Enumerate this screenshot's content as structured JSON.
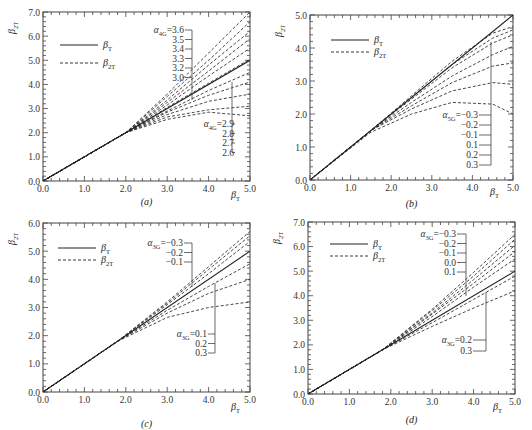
{
  "figure": {
    "panels_count": 4
  },
  "chart_data": [
    {
      "panel": "(a)",
      "type": "line",
      "xlabel": "β_T",
      "ylabel": "β_2T",
      "xlim": [
        0,
        5
      ],
      "ylim": [
        0,
        7
      ],
      "xticks": [
        "0.0",
        "1.0",
        "2.0",
        "3.0",
        "4.0",
        "5.0"
      ],
      "yticks": [
        "0.0",
        "1.0",
        "2.0",
        "3.0",
        "4.0",
        "5.0",
        "6.0",
        "7.0"
      ],
      "legend": [
        {
          "label": "β_T",
          "style": "solid"
        },
        {
          "label": "β_2T",
          "style": "dashed"
        }
      ],
      "parameter": "α_4G",
      "annotations": [
        {
          "text": "α_4G=3.6",
          "group": "upper"
        },
        {
          "text": "3.5",
          "group": "upper"
        },
        {
          "text": "3.4",
          "group": "upper"
        },
        {
          "text": "3.3",
          "group": "upper"
        },
        {
          "text": "3.2",
          "group": "upper"
        },
        {
          "text": "3.0",
          "group": "upper"
        },
        {
          "text": "α_4G=2.9",
          "group": "lower"
        },
        {
          "text": "2.8",
          "group": "lower"
        },
        {
          "text": "2.7",
          "group": "lower"
        },
        {
          "text": "2.6",
          "group": "lower"
        }
      ],
      "reference": {
        "name": "β_T",
        "x": [
          0,
          5
        ],
        "y": [
          0,
          5
        ]
      },
      "branch_start": 2.0,
      "series": [
        {
          "name": "α_4G=3.6",
          "x": [
            0,
            2.0,
            3.0,
            4.0,
            5.0
          ],
          "y": [
            0,
            2.0,
            3.6,
            5.3,
            7.0
          ]
        },
        {
          "name": "α_4G=3.5",
          "x": [
            0,
            2.0,
            3.0,
            4.0,
            5.0
          ],
          "y": [
            0,
            2.0,
            3.5,
            5.0,
            6.6
          ]
        },
        {
          "name": "α_4G=3.4",
          "x": [
            0,
            2.0,
            3.0,
            4.0,
            5.0
          ],
          "y": [
            0,
            2.0,
            3.35,
            4.8,
            6.2
          ]
        },
        {
          "name": "α_4G=3.3",
          "x": [
            0,
            2.0,
            3.0,
            4.0,
            5.0
          ],
          "y": [
            0,
            2.0,
            3.25,
            4.55,
            5.9
          ]
        },
        {
          "name": "α_4G=3.2",
          "x": [
            0,
            2.0,
            3.0,
            4.0,
            5.0
          ],
          "y": [
            0,
            2.0,
            3.15,
            4.35,
            5.5
          ]
        },
        {
          "name": "α_4G=3.0",
          "x": [
            0,
            2.0,
            3.0,
            4.0,
            5.0
          ],
          "y": [
            0,
            2.0,
            3.05,
            4.05,
            5.05
          ]
        },
        {
          "name": "α_4G=2.9",
          "x": [
            0,
            2.0,
            3.0,
            4.0,
            5.0
          ],
          "y": [
            0,
            2.0,
            2.9,
            3.75,
            4.5
          ]
        },
        {
          "name": "α_4G=2.8",
          "x": [
            0,
            2.0,
            3.0,
            4.0,
            5.0
          ],
          "y": [
            0,
            2.0,
            2.85,
            3.55,
            4.1
          ]
        },
        {
          "name": "α_4G=2.7",
          "x": [
            0,
            2.0,
            3.0,
            4.0,
            5.0
          ],
          "y": [
            0,
            2.0,
            2.75,
            3.3,
            3.6
          ]
        },
        {
          "name": "α_4G=2.6",
          "x": [
            0,
            2.0,
            3.0,
            4.0,
            5.0
          ],
          "y": [
            0,
            2.0,
            2.65,
            2.95,
            3.1
          ]
        },
        {
          "name": "α_4G=2.55",
          "x": [
            0,
            2.0,
            3.0,
            4.0,
            5.0
          ],
          "y": [
            0,
            2.0,
            2.55,
            2.85,
            2.7
          ]
        }
      ]
    },
    {
      "panel": "(b)",
      "type": "line",
      "xlabel": "β_T",
      "ylabel": "β_2T",
      "xlim": [
        0,
        5
      ],
      "ylim": [
        0,
        5
      ],
      "xticks": [
        "0.0",
        "1.0",
        "2.0",
        "3.0",
        "4.0",
        "5.0"
      ],
      "yticks": [
        "0.0",
        "1.0",
        "2.0",
        "3.0",
        "4.0",
        "5.0"
      ],
      "legend": [
        {
          "label": "β_T",
          "style": "solid"
        },
        {
          "label": "β_2T",
          "style": "dashed"
        }
      ],
      "parameter": "α_5G",
      "annotations": [
        {
          "text": "α_5G=−0.3"
        },
        {
          "text": "−0.2"
        },
        {
          "text": "−0.1"
        },
        {
          "text": "0.1"
        },
        {
          "text": "0.2"
        },
        {
          "text": "0.3"
        }
      ],
      "reference": {
        "name": "β_T",
        "x": [
          0,
          5
        ],
        "y": [
          0,
          5
        ]
      },
      "series": [
        {
          "name": "α_5G=−0.3",
          "x": [
            0,
            1.5,
            2.5,
            3.5,
            4.5,
            5.0
          ],
          "y": [
            0,
            1.5,
            2.55,
            3.6,
            4.45,
            4.65
          ]
        },
        {
          "name": "α_5G=−0.2",
          "x": [
            0,
            1.5,
            2.5,
            3.5,
            4.5,
            5.0
          ],
          "y": [
            0,
            1.5,
            2.5,
            3.5,
            4.3,
            4.55
          ]
        },
        {
          "name": "α_5G=−0.1",
          "x": [
            0,
            1.5,
            2.5,
            3.5,
            4.5,
            5.0
          ],
          "y": [
            0,
            1.5,
            2.45,
            3.4,
            4.15,
            4.4
          ]
        },
        {
          "name": "α_5G=0.1",
          "x": [
            0,
            1.5,
            2.5,
            3.5,
            4.5,
            5.0
          ],
          "y": [
            0,
            1.5,
            2.35,
            3.15,
            3.8,
            4.05
          ]
        },
        {
          "name": "α_5G=0.2",
          "x": [
            0,
            1.5,
            2.5,
            3.5,
            4.5,
            5.0
          ],
          "y": [
            0,
            1.5,
            2.25,
            2.95,
            3.45,
            3.55
          ]
        },
        {
          "name": "α_5G=0.3",
          "x": [
            0,
            1.5,
            2.5,
            3.5,
            4.5,
            5.0
          ],
          "y": [
            0,
            1.5,
            2.15,
            2.7,
            2.95,
            2.9
          ]
        },
        {
          "name": "α_5G=0.4",
          "x": [
            0,
            1.5,
            2.5,
            3.5,
            4.5,
            5.0
          ],
          "y": [
            0,
            1.45,
            2.0,
            2.35,
            2.3,
            2.0
          ]
        }
      ]
    },
    {
      "panel": "(c)",
      "type": "line",
      "xlabel": "β_T",
      "ylabel": "β_2T",
      "xlim": [
        0,
        5
      ],
      "ylim": [
        0,
        6
      ],
      "xticks": [
        "0.0",
        "1.0",
        "2.0",
        "3.0",
        "4.0",
        "5.0"
      ],
      "yticks": [
        "0.0",
        "1.0",
        "2.0",
        "3.0",
        "4.0",
        "5.0",
        "6.0"
      ],
      "legend": [
        {
          "label": "β_T",
          "style": "solid"
        },
        {
          "label": "β_2T",
          "style": "dashed"
        }
      ],
      "parameter": "α_3G",
      "annotations": [
        {
          "text": "α_3G=−0.3",
          "group": "upper"
        },
        {
          "text": "−0.2",
          "group": "upper"
        },
        {
          "text": "−0.1",
          "group": "upper"
        },
        {
          "text": "α_3G=0.1",
          "group": "lower"
        },
        {
          "text": "0.2",
          "group": "lower"
        },
        {
          "text": "0.3",
          "group": "lower"
        }
      ],
      "reference": {
        "name": "β_T",
        "x": [
          0,
          5
        ],
        "y": [
          0,
          5
        ]
      },
      "series": [
        {
          "name": "α_3G=−0.3",
          "x": [
            0,
            1.8,
            3.0,
            4.0,
            5.0
          ],
          "y": [
            0,
            1.8,
            3.2,
            4.45,
            5.7
          ]
        },
        {
          "name": "α_3G=−0.2",
          "x": [
            0,
            1.8,
            3.0,
            4.0,
            5.0
          ],
          "y": [
            0,
            1.8,
            3.15,
            4.35,
            5.55
          ]
        },
        {
          "name": "α_3G=−0.1",
          "x": [
            0,
            1.8,
            3.0,
            4.0,
            5.0
          ],
          "y": [
            0,
            1.8,
            3.1,
            4.2,
            5.35
          ]
        },
        {
          "name": "α_3G=0.1",
          "x": [
            0,
            1.8,
            3.0,
            4.0,
            5.0
          ],
          "y": [
            0,
            1.8,
            2.9,
            3.75,
            4.55
          ]
        },
        {
          "name": "α_3G=0.2",
          "x": [
            0,
            1.8,
            3.0,
            4.0,
            5.0
          ],
          "y": [
            0,
            1.8,
            2.8,
            3.5,
            4.0
          ]
        },
        {
          "name": "α_3G=0.3",
          "x": [
            0,
            1.8,
            3.0,
            4.0,
            5.0
          ],
          "y": [
            0,
            1.8,
            2.65,
            3.0,
            3.2
          ]
        }
      ]
    },
    {
      "panel": "(d)",
      "type": "line",
      "xlabel": "β_T",
      "ylabel": "β_2T",
      "xlim": [
        0,
        5
      ],
      "ylim": [
        0,
        7
      ],
      "xticks": [
        "0.0",
        "1.0",
        "2.0",
        "3.0",
        "4.0",
        "5.0"
      ],
      "yticks": [
        "0.0",
        "1.0",
        "2.0",
        "3.0",
        "4.0",
        "5.0",
        "6.0",
        "7.0"
      ],
      "legend": [
        {
          "label": "β_T",
          "style": "solid"
        },
        {
          "label": "β_2T",
          "style": "dashed"
        }
      ],
      "parameter": "α_3G",
      "annotations": [
        {
          "text": "α_3G=−0.3",
          "group": "upper"
        },
        {
          "text": "−0.2",
          "group": "upper"
        },
        {
          "text": "−0.1",
          "group": "upper"
        },
        {
          "text": "0.0",
          "group": "upper"
        },
        {
          "text": "0.1",
          "group": "upper"
        },
        {
          "text": "α_3G=0.2",
          "group": "lower"
        },
        {
          "text": "0.3",
          "group": "lower"
        }
      ],
      "reference": {
        "name": "β_T",
        "x": [
          0,
          5
        ],
        "y": [
          0,
          5
        ]
      },
      "series": [
        {
          "name": "α_3G=−0.3",
          "x": [
            0,
            1.8,
            3.0,
            4.0,
            5.0
          ],
          "y": [
            0,
            1.8,
            3.45,
            4.95,
            6.5
          ]
        },
        {
          "name": "α_3G=−0.2",
          "x": [
            0,
            1.8,
            3.0,
            4.0,
            5.0
          ],
          "y": [
            0,
            1.8,
            3.4,
            4.8,
            6.3
          ]
        },
        {
          "name": "α_3G=−0.1",
          "x": [
            0,
            1.8,
            3.0,
            4.0,
            5.0
          ],
          "y": [
            0,
            1.8,
            3.3,
            4.65,
            6.05
          ]
        },
        {
          "name": "α_3G=0.0",
          "x": [
            0,
            1.8,
            3.0,
            4.0,
            5.0
          ],
          "y": [
            0,
            1.8,
            3.25,
            4.5,
            5.8
          ]
        },
        {
          "name": "α_3G=0.1",
          "x": [
            0,
            1.8,
            3.0,
            4.0,
            5.0
          ],
          "y": [
            0,
            1.8,
            3.15,
            4.35,
            5.5
          ]
        },
        {
          "name": "α_3G=0.2",
          "x": [
            0,
            1.8,
            3.0,
            4.0,
            5.0
          ],
          "y": [
            0,
            1.8,
            2.9,
            3.85,
            4.8
          ]
        },
        {
          "name": "α_3G=0.3",
          "x": [
            0,
            1.8,
            3.0,
            4.0,
            5.0
          ],
          "y": [
            0,
            1.8,
            2.75,
            3.5,
            4.2
          ]
        }
      ]
    }
  ],
  "layout": {
    "panels": [
      {
        "x0": 43,
        "x1": 250,
        "y0": 181,
        "y1": 12,
        "label_y": 205,
        "xlabel_y": 198,
        "xlabel_x": 231,
        "legend": {
          "x": 60,
          "y1": 45,
          "y2": 63
        },
        "anno_upper": {
          "x": 184,
          "y": 30,
          "dy": 9.5,
          "barx": 192,
          "bar_to_y": 100
        },
        "anno_lower": {
          "x": 234,
          "y": 124,
          "dy": 9.5,
          "barx": 232,
          "bar_top": 82
        }
      },
      {
        "x0": 310,
        "x1": 513,
        "y0": 180,
        "y1": 15,
        "label_y": 207,
        "xlabel_y": 195,
        "xlabel_x": 490,
        "legend": {
          "x": 331,
          "y1": 40,
          "y2": 52
        },
        "anno_lower": {
          "x": 478,
          "y": 115,
          "dy": 10,
          "barx": 491,
          "bar_top": 42
        }
      },
      {
        "x0": 43,
        "x1": 250,
        "y0": 392,
        "y1": 223,
        "label_y": 427,
        "xlabel_y": 410,
        "xlabel_x": 231,
        "legend": {
          "x": 58,
          "y1": 248,
          "y2": 260
        },
        "anno_upper": {
          "x": 183,
          "y": 243,
          "dy": 9.5,
          "barx": 192,
          "bar_to_y": 287
        },
        "anno_lower": {
          "x": 207,
          "y": 334,
          "dy": 9.5,
          "barx": 215,
          "bar_top": 283
        }
      },
      {
        "x0": 308,
        "x1": 515,
        "y0": 394,
        "y1": 222,
        "label_y": 423,
        "xlabel_y": 410,
        "xlabel_x": 493,
        "legend": {
          "x": 330,
          "y1": 244,
          "y2": 256
        },
        "anno_upper": {
          "x": 456,
          "y": 234,
          "dy": 9.5,
          "barx": 466,
          "bar_to_y": 296
        },
        "anno_lower": {
          "x": 472,
          "y": 340,
          "dy": 11,
          "barx": 486,
          "bar_top": 292
        }
      }
    ]
  }
}
